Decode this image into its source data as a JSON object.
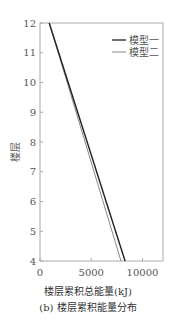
{
  "chart_data": {
    "type": "line",
    "title": "",
    "subtitle": "(b) 楼层累积能量分布",
    "xlabel": "楼层累积总能量(kJ)",
    "ylabel": "楼层",
    "xlim": [
      0,
      12000
    ],
    "ylim": [
      4,
      12
    ],
    "xticks": [
      0,
      5000,
      10000
    ],
    "xtick_labels": [
      "0",
      "5000",
      "10000"
    ],
    "yticks": [
      4,
      5,
      6,
      7,
      8,
      9,
      10,
      11,
      12
    ],
    "ytick_labels": [
      "4",
      "5",
      "6",
      "7",
      "8",
      "9",
      "10",
      "11",
      "12"
    ],
    "grid": false,
    "legend_position": "upper right",
    "series": [
      {
        "name": "模型一",
        "color": "#222222",
        "x": [
          900,
          8300
        ],
        "y": [
          12,
          4
        ]
      },
      {
        "name": "模型二",
        "color": "#888888",
        "x": [
          900,
          7900
        ],
        "y": [
          12,
          4
        ]
      }
    ]
  },
  "legend": {
    "items": [
      "模型一",
      "模型二"
    ]
  },
  "axis": {
    "ylabel": "楼层",
    "xlabel": "楼层累积总能量(kJ)"
  },
  "caption": "(b) 楼层累积能量分布"
}
